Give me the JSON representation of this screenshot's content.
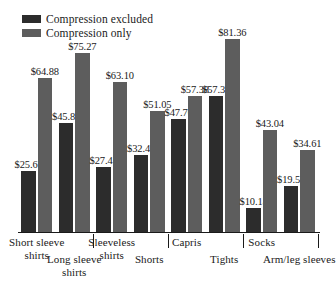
{
  "legend": {
    "items": [
      {
        "label": "Compression excluded",
        "color": "#2c2c2c",
        "swatch_name": "legend-swatch-dark"
      },
      {
        "label": "Compression only",
        "color": "#5d5d5d",
        "swatch_name": "legend-swatch-gray"
      }
    ]
  },
  "chart_data": {
    "type": "bar",
    "title": "",
    "xlabel": "",
    "ylabel": "",
    "ylim": [
      0,
      90
    ],
    "grid": false,
    "legend_position": "top-left",
    "value_prefix": "$",
    "categories": [
      "Short sleeve shirts",
      "Long sleeve shirts",
      "Sleeveless shirts",
      "Shorts",
      "Capris",
      "Tights",
      "Socks",
      "Arm/leg sleeves"
    ],
    "series": [
      {
        "name": "Compression excluded",
        "color": "#2c2c2c",
        "values": [
          25.67,
          45.81,
          27.42,
          32.41,
          47.7,
          57.38,
          10.14,
          19.51
        ],
        "labels": [
          "$25.67",
          "$45.81",
          "$27.42",
          "$32.41",
          "$47.70",
          "$57.38",
          "$10.14",
          "$19.51"
        ]
      },
      {
        "name": "Compression only",
        "color": "#5d5d5d",
        "values": [
          64.88,
          75.27,
          63.1,
          51.05,
          57.38,
          81.36,
          43.04,
          34.61
        ],
        "labels": [
          "$64.88",
          "$75.27",
          "$63.10",
          "$51.05",
          "$57.38",
          "$81.36",
          "$43.04",
          "$34.61"
        ]
      }
    ]
  },
  "axis": {
    "category_labels": [
      {
        "text": "Short sleeve shirts",
        "row": 0
      },
      {
        "text": "Long sleeve shirts",
        "row": 1
      },
      {
        "text": "Sleeveless shirts",
        "row": 0
      },
      {
        "text": "Shorts",
        "row": 1
      },
      {
        "text": "Capris",
        "row": 0
      },
      {
        "text": "Tights",
        "row": 1
      },
      {
        "text": "Socks",
        "row": 0
      },
      {
        "text": "Arm/leg sleeves",
        "row": 1
      }
    ]
  }
}
